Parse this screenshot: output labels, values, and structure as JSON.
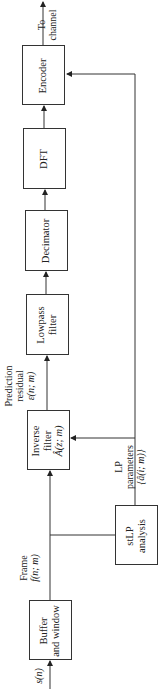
{
  "diagram": {
    "type": "block-diagram",
    "orientation": "rotated-90-ccw",
    "blocks": [
      {
        "id": "buffer",
        "line1": "Buffer",
        "line2": "and window"
      },
      {
        "id": "stlp",
        "line1": "stLP",
        "line2": "analysis"
      },
      {
        "id": "inverse",
        "line1": "Inverse",
        "line2": "filter",
        "line3": "Â(z; m)"
      },
      {
        "id": "lowpass",
        "line1": "Lowpass",
        "line2": "filter"
      },
      {
        "id": "decimator",
        "line1": "Decimator"
      },
      {
        "id": "dft",
        "line1": "DFT"
      },
      {
        "id": "encoder",
        "line1": "Encoder"
      }
    ],
    "signals": {
      "input": "s(n)",
      "frame_label": "Frame",
      "frame_symbol": "f(n; m)",
      "residual_line1": "Prediction",
      "residual_line2": "residual",
      "residual_symbol": "ε(n; m)",
      "lp_line1": "LP",
      "lp_line2": "parameters",
      "lp_symbol": "{â(i; m)}",
      "output_line1": "To",
      "output_line2": "channel"
    },
    "connections": [
      "s(n) -> Buffer and window",
      "Buffer and window -> Inverse filter",
      "Buffer and window -> stLP analysis",
      "stLP analysis -> Inverse filter",
      "stLP analysis -> Encoder",
      "Inverse filter -> Lowpass filter",
      "Lowpass filter -> Decimator",
      "Decimator -> DFT",
      "DFT -> Encoder",
      "Encoder -> To channel"
    ],
    "caption": ""
  }
}
